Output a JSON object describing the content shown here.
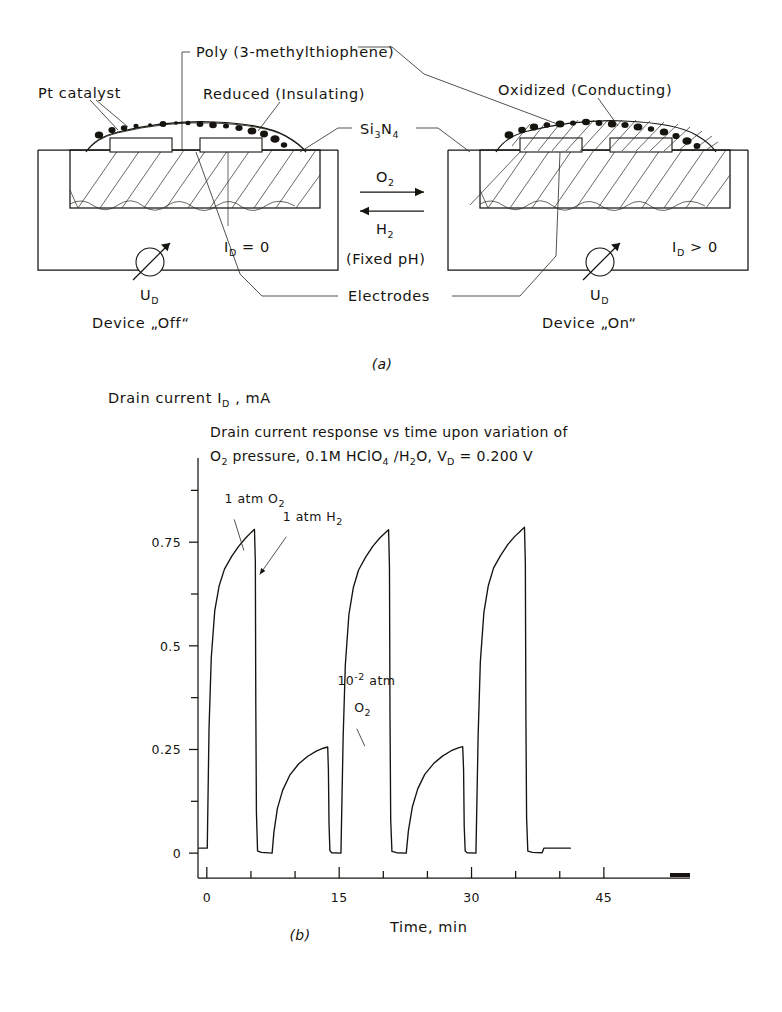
{
  "figure": {
    "panel_a_caption": "(a)",
    "panel_b_caption": "(b)"
  },
  "diagram": {
    "labels": {
      "poly": "Poly (3-methylthiophene)",
      "pt_catalyst": "Pt catalyst",
      "reduced": "Reduced (Insulating)",
      "oxidized": "Oxidized (Conducting)",
      "si3n4_main": "Si",
      "si3n4_sub1": "3",
      "si3n4_mid": "N",
      "si3n4_sub2": "4",
      "electrodes": "Electrodes",
      "fixed_ph": "(Fixed pH)",
      "arrow_top_gas": "O",
      "arrow_top_gas_sub": "2",
      "arrow_bottom_gas": "H",
      "arrow_bottom_gas_sub": "2",
      "device_off": "Device „Off“",
      "device_on": "Device „On“",
      "id_off": "I",
      "id_off_sub": "D",
      "id_off_rel": " = 0",
      "id_on": "I",
      "id_on_sub": "D",
      "id_on_rel": " > 0",
      "ud_left": "U",
      "ud_left_sub": "D",
      "ud_right": "U",
      "ud_right_sub": "D"
    }
  },
  "chart_data": {
    "type": "line",
    "title_line1": "Drain current response vs time upon variation of",
    "title_line2_parts": {
      "o": "O",
      "o_sub": "2",
      "mid": " pressure, 0.1M HClO",
      "hclo_sub": "4",
      "slash": " /H",
      "h2o_sub": "2",
      "o_end": "O,   V",
      "v_sub": "D",
      "value": " = 0.200 V"
    },
    "ylabel_parts": {
      "main": "Drain current   I",
      "sub": "D",
      "unit": " , mA"
    },
    "xlabel": "Time, min",
    "xlim": [
      -1,
      50
    ],
    "ylim": [
      -0.06,
      0.9
    ],
    "xticks": [
      0,
      15,
      30,
      45
    ],
    "xticklabels": [
      "0",
      "15",
      "30",
      "45"
    ],
    "xminor_step": 5,
    "yticks": [
      0,
      0.25,
      0.5,
      0.75
    ],
    "yticklabels": [
      "0",
      "0.25",
      "0.5",
      "0.75"
    ],
    "yminor": [
      0.125,
      0.375,
      0.625,
      0.875
    ],
    "grid": false,
    "legend": "none",
    "annotations": [
      {
        "text": "1 atm O",
        "sub": "2",
        "x": 2.0,
        "y": 0.845,
        "name": "annotation-1-atm-o2"
      },
      {
        "text": "1 atm H",
        "sub": "2",
        "x": 8.6,
        "y": 0.8,
        "name": "annotation-1-atm-h2"
      },
      {
        "text": "10",
        "sup": "-2",
        "tail": " atm",
        "x": 14.8,
        "y": 0.405,
        "name": "annotation-1e-2-atm-o2-line1"
      },
      {
        "text": "O",
        "sub": "2",
        "x": 16.7,
        "y": 0.34,
        "name": "annotation-1e-2-atm-o2-line2"
      }
    ],
    "series": [
      {
        "name": "drain current",
        "comment": "Repeating O2 / H2 exposure cycles; sharp vertical drops when H2 admitted.",
        "points": [
          [
            -0.9,
            0.012
          ],
          [
            -0.1,
            0.012
          ],
          [
            0.05,
            0.012
          ],
          [
            0.25,
            0.3
          ],
          [
            0.5,
            0.47
          ],
          [
            0.9,
            0.585
          ],
          [
            1.4,
            0.645
          ],
          [
            2.0,
            0.685
          ],
          [
            2.8,
            0.715
          ],
          [
            3.6,
            0.74
          ],
          [
            4.4,
            0.76
          ],
          [
            5.0,
            0.773
          ],
          [
            5.4,
            0.781
          ],
          [
            5.5,
            0.7
          ],
          [
            5.55,
            0.36
          ],
          [
            5.62,
            0.1
          ],
          [
            5.75,
            0.005
          ],
          [
            6.2,
            0.002
          ],
          [
            7.4,
            0.0
          ],
          [
            7.6,
            0.05
          ],
          [
            8.0,
            0.108
          ],
          [
            8.6,
            0.152
          ],
          [
            9.4,
            0.188
          ],
          [
            10.4,
            0.215
          ],
          [
            11.4,
            0.233
          ],
          [
            12.4,
            0.246
          ],
          [
            13.2,
            0.253
          ],
          [
            13.7,
            0.256
          ],
          [
            13.78,
            0.2
          ],
          [
            13.85,
            0.07
          ],
          [
            13.95,
            0.006
          ],
          [
            14.15,
            0.001
          ],
          [
            15.2,
            0.0
          ],
          [
            15.45,
            0.28
          ],
          [
            15.7,
            0.455
          ],
          [
            16.1,
            0.575
          ],
          [
            16.6,
            0.64
          ],
          [
            17.2,
            0.683
          ],
          [
            18.0,
            0.714
          ],
          [
            18.8,
            0.74
          ],
          [
            19.6,
            0.76
          ],
          [
            20.2,
            0.772
          ],
          [
            20.6,
            0.78
          ],
          [
            20.7,
            0.69
          ],
          [
            20.76,
            0.33
          ],
          [
            20.84,
            0.08
          ],
          [
            20.98,
            0.004
          ],
          [
            21.5,
            0.001
          ],
          [
            22.6,
            0.0
          ],
          [
            22.85,
            0.055
          ],
          [
            23.3,
            0.112
          ],
          [
            23.9,
            0.155
          ],
          [
            24.7,
            0.19
          ],
          [
            25.7,
            0.216
          ],
          [
            26.7,
            0.234
          ],
          [
            27.7,
            0.247
          ],
          [
            28.5,
            0.254
          ],
          [
            29.0,
            0.257
          ],
          [
            29.1,
            0.2
          ],
          [
            29.17,
            0.065
          ],
          [
            29.28,
            0.005
          ],
          [
            29.5,
            0.001
          ],
          [
            30.5,
            0.0
          ],
          [
            30.75,
            0.285
          ],
          [
            31.0,
            0.462
          ],
          [
            31.4,
            0.58
          ],
          [
            31.9,
            0.645
          ],
          [
            32.5,
            0.688
          ],
          [
            33.3,
            0.718
          ],
          [
            34.1,
            0.744
          ],
          [
            34.9,
            0.764
          ],
          [
            35.5,
            0.776
          ],
          [
            36.0,
            0.786
          ],
          [
            36.1,
            0.7
          ],
          [
            36.16,
            0.34
          ],
          [
            36.24,
            0.085
          ],
          [
            36.38,
            0.005
          ],
          [
            36.9,
            0.002
          ],
          [
            38.0,
            0.001
          ],
          [
            38.2,
            0.012
          ],
          [
            39.6,
            0.012
          ],
          [
            41.2,
            0.012
          ]
        ]
      }
    ]
  }
}
